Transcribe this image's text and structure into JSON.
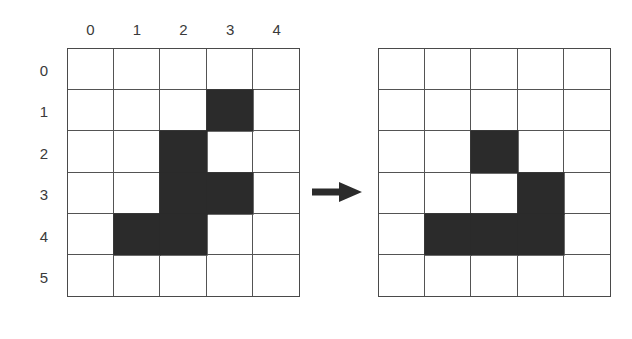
{
  "figure": {
    "kind": "grid-transformation-diagram",
    "arrow_icon": "right-arrow-icon",
    "colors": {
      "filled_cell": "#2b2b2b",
      "empty_cell": "#ffffff",
      "grid_line": "#545454",
      "grid_border": "#4a4a4a",
      "label_text": "#3a3a3a",
      "arrow": "#2b2b2b",
      "background": "#ffffff"
    }
  },
  "axes": {
    "column_labels": [
      "0",
      "1",
      "2",
      "3",
      "4"
    ],
    "row_labels": [
      "0",
      "1",
      "2",
      "3",
      "4",
      "5"
    ]
  },
  "chart_data": {
    "type": "heatmap",
    "title": "",
    "xlabel": "",
    "ylabel": "",
    "grid": true,
    "legend": "none",
    "columns": 5,
    "rows": 6,
    "categories": [
      "0",
      "1",
      "2",
      "3",
      "4"
    ],
    "row_categories": [
      "0",
      "1",
      "2",
      "3",
      "4",
      "5"
    ],
    "panels": [
      {
        "name": "before",
        "position": "left",
        "filled_cells": [
          {
            "row": 1,
            "col": 3
          },
          {
            "row": 2,
            "col": 2
          },
          {
            "row": 3,
            "col": 2
          },
          {
            "row": 3,
            "col": 3
          },
          {
            "row": 4,
            "col": 1
          },
          {
            "row": 4,
            "col": 2
          }
        ],
        "values": [
          [
            0,
            0,
            0,
            0,
            0
          ],
          [
            0,
            0,
            0,
            1,
            0
          ],
          [
            0,
            0,
            1,
            0,
            0
          ],
          [
            0,
            0,
            1,
            1,
            0
          ],
          [
            0,
            1,
            1,
            0,
            0
          ],
          [
            0,
            0,
            0,
            0,
            0
          ]
        ]
      },
      {
        "name": "after",
        "position": "right",
        "filled_cells": [
          {
            "row": 2,
            "col": 2
          },
          {
            "row": 3,
            "col": 3
          },
          {
            "row": 4,
            "col": 1
          },
          {
            "row": 4,
            "col": 2
          },
          {
            "row": 4,
            "col": 3
          }
        ],
        "values": [
          [
            0,
            0,
            0,
            0,
            0
          ],
          [
            0,
            0,
            0,
            0,
            0
          ],
          [
            0,
            0,
            1,
            0,
            0
          ],
          [
            0,
            0,
            0,
            1,
            0
          ],
          [
            0,
            1,
            1,
            1,
            0
          ],
          [
            0,
            0,
            0,
            0,
            0
          ]
        ]
      }
    ]
  }
}
